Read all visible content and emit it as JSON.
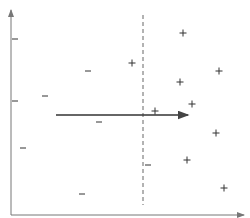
{
  "diagram": {
    "colors": {
      "axis": "#555555",
      "boundary": "#666666",
      "arrow": "#333333",
      "marker": "#333333"
    },
    "axes": {
      "y_axis": {
        "x": 11,
        "y1": 215,
        "y2": 10
      },
      "x_axis": {
        "y": 215,
        "x1": 11,
        "x2": 244
      }
    },
    "boundary": {
      "x": 143,
      "y1": 15,
      "y2": 205,
      "style": "dashed"
    },
    "arrow": {
      "x1": 56,
      "y1": 115,
      "x2": 188,
      "y2": 115
    },
    "negatives": {
      "symbol": "−",
      "points": [
        [
          15,
          39
        ],
        [
          88,
          71
        ],
        [
          15,
          101
        ],
        [
          45,
          96
        ],
        [
          99,
          122
        ],
        [
          23,
          148
        ],
        [
          148,
          165
        ],
        [
          82,
          194
        ]
      ]
    },
    "positives": {
      "symbol": "+",
      "points": [
        [
          183,
          33
        ],
        [
          132,
          63
        ],
        [
          219,
          71
        ],
        [
          180,
          82
        ],
        [
          192,
          104
        ],
        [
          155,
          111
        ],
        [
          216,
          133
        ],
        [
          187,
          160
        ],
        [
          224,
          188
        ]
      ]
    }
  }
}
